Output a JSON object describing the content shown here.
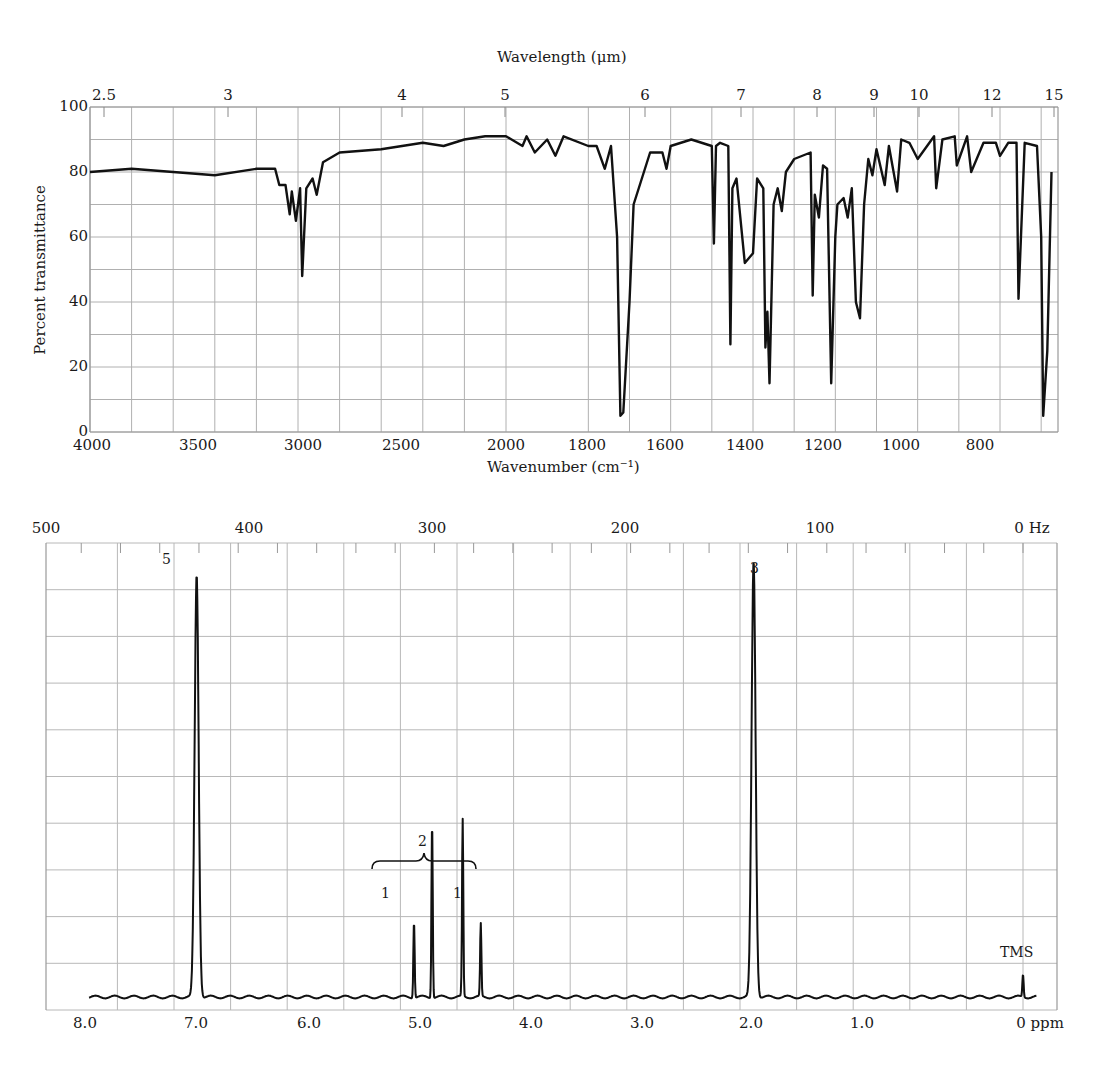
{
  "chart_data": [
    {
      "type": "line",
      "title": "IR spectrum",
      "top_axis": {
        "label": "Wavelength (μm)",
        "ticks": [
          "2.5",
          "3",
          "4",
          "5",
          "6",
          "7",
          "8",
          "9",
          "10",
          "12",
          "15"
        ]
      },
      "xlabel": "Wavenumber (cm⁻¹)",
      "ylabel": "Percent transmittance",
      "x_ticks": [
        "4000",
        "3500",
        "3000",
        "2500",
        "2000",
        "1800",
        "1600",
        "1400",
        "1200",
        "1000",
        "800"
      ],
      "y_ticks": [
        "0",
        "20",
        "40",
        "60",
        "80",
        "100"
      ],
      "xlim": [
        4000,
        670
      ],
      "ylim": [
        0,
        100
      ],
      "grid": true,
      "x": [
        4000,
        3800,
        3600,
        3400,
        3200,
        3110,
        3090,
        3060,
        3040,
        3030,
        3010,
        2990,
        2980,
        2960,
        2930,
        2910,
        2880,
        2800,
        2600,
        2400,
        2300,
        2200,
        2100,
        2000,
        1960,
        1950,
        1930,
        1900,
        1880,
        1860,
        1800,
        1780,
        1760,
        1745,
        1730,
        1722,
        1715,
        1700,
        1690,
        1650,
        1620,
        1610,
        1600,
        1550,
        1500,
        1495,
        1490,
        1480,
        1460,
        1455,
        1450,
        1440,
        1420,
        1400,
        1390,
        1375,
        1370,
        1365,
        1360,
        1350,
        1340,
        1330,
        1320,
        1300,
        1260,
        1255,
        1250,
        1240,
        1230,
        1220,
        1210,
        1200,
        1195,
        1180,
        1170,
        1160,
        1150,
        1140,
        1130,
        1120,
        1110,
        1100,
        1080,
        1070,
        1050,
        1040,
        1020,
        1000,
        960,
        955,
        940,
        910,
        905,
        880,
        870,
        840,
        810,
        800,
        780,
        760,
        755,
        740,
        710,
        700,
        695,
        685,
        675
      ],
      "values": [
        80,
        81,
        80,
        79,
        81,
        81,
        76,
        76,
        67,
        74,
        65,
        75,
        48,
        75,
        78,
        73,
        83,
        86,
        87,
        89,
        88,
        90,
        91,
        91,
        88,
        91,
        86,
        90,
        85,
        91,
        88,
        88,
        81,
        88,
        60,
        5,
        6,
        40,
        70,
        86,
        86,
        81,
        88,
        90,
        88,
        58,
        88,
        89,
        88,
        27,
        75,
        78,
        52,
        55,
        78,
        75,
        26,
        37,
        15,
        70,
        75,
        68,
        80,
        84,
        86,
        42,
        73,
        66,
        82,
        81,
        15,
        60,
        70,
        72,
        66,
        75,
        40,
        35,
        70,
        84,
        79,
        87,
        76,
        88,
        74,
        90,
        89,
        84,
        91,
        75,
        90,
        91,
        82,
        91,
        80,
        89,
        89,
        85,
        89,
        89,
        41,
        89,
        88,
        60,
        5,
        25,
        80
      ],
      "units": {
        "x": "cm⁻¹",
        "y": "%T"
      }
    },
    {
      "type": "line",
      "title": "1H NMR spectrum",
      "top_axis": {
        "label": "Hz",
        "ticks": [
          "500",
          "400",
          "300",
          "200",
          "100",
          "0 Hz"
        ]
      },
      "xlabel": "ppm",
      "x_ticks": [
        "8.0",
        "7.0",
        "6.0",
        "5.0",
        "4.0",
        "3.0",
        "2.0",
        "1.0",
        "0 ppm"
      ],
      "xlim": [
        8.3,
        -0.1
      ],
      "grid": true,
      "peaks": [
        {
          "shift_ppm": 7.3,
          "integration_label": "5",
          "relative_height": 0.93
        },
        {
          "shift_ppm": 5.38,
          "relative_height": 0.17
        },
        {
          "shift_ppm": 5.22,
          "relative_height": 0.39
        },
        {
          "shift_ppm": 4.95,
          "relative_height": 0.39
        },
        {
          "shift_ppm": 4.79,
          "relative_height": 0.16
        },
        {
          "shift_ppm": 2.38,
          "integration_label": "3",
          "relative_height": 0.96
        },
        {
          "shift_ppm": 0.0,
          "label": "TMS",
          "relative_height": 0.05
        }
      ],
      "annotations": [
        {
          "text": "5",
          "at_ppm": 7.3
        },
        {
          "text": "2",
          "type": "brace",
          "from_ppm": 5.5,
          "to_ppm": 4.65
        },
        {
          "text": "1",
          "at_ppm": 5.3
        },
        {
          "text": "1",
          "at_ppm": 4.87
        },
        {
          "text": "3",
          "at_ppm": 2.38
        },
        {
          "text": "TMS",
          "at_ppm": 0.0
        }
      ]
    }
  ],
  "ir": {
    "top_title": "Wavelength (μm)",
    "bottom_title": "Wavenumber (cm⁻¹)",
    "ylabel": "Percent transmittance",
    "top_ticks": [
      {
        "t": "2.5",
        "x": 104
      },
      {
        "t": "3",
        "x": 228
      },
      {
        "t": "4",
        "x": 402
      },
      {
        "t": "5",
        "x": 505
      },
      {
        "t": "6",
        "x": 645
      },
      {
        "t": "7",
        "x": 741
      },
      {
        "t": "8",
        "x": 817
      },
      {
        "t": "9",
        "x": 874
      },
      {
        "t": "10",
        "x": 919
      },
      {
        "t": "12",
        "x": 992
      },
      {
        "t": "15",
        "x": 1054
      }
    ],
    "bottom_ticks": [
      {
        "t": "4000",
        "x": 92
      },
      {
        "t": "3500",
        "x": 198
      },
      {
        "t": "3000",
        "x": 303
      },
      {
        "t": "2500",
        "x": 401
      },
      {
        "t": "2000",
        "x": 506
      },
      {
        "t": "1800",
        "x": 587
      },
      {
        "t": "1600",
        "x": 665
      },
      {
        "t": "1400",
        "x": 745
      },
      {
        "t": "1200",
        "x": 823
      },
      {
        "t": "1000",
        "x": 901
      },
      {
        "t": "800",
        "x": 980
      }
    ],
    "y_ticks": [
      {
        "t": "100",
        "y": 107
      },
      {
        "t": "80",
        "y": 172
      },
      {
        "t": "60",
        "y": 237
      },
      {
        "t": "40",
        "y": 302
      },
      {
        "t": "20",
        "y": 367
      },
      {
        "t": "0",
        "y": 432
      }
    ]
  },
  "nmr": {
    "hz_ticks": [
      {
        "t": "500",
        "x": 46
      },
      {
        "t": "400",
        "x": 249
      },
      {
        "t": "300",
        "x": 432
      },
      {
        "t": "200",
        "x": 625
      },
      {
        "t": "100",
        "x": 820
      },
      {
        "t": "0  Hz",
        "x": 1032
      }
    ],
    "ppm_ticks": [
      {
        "t": "8.0",
        "x": 85
      },
      {
        "t": "7.0",
        "x": 196
      },
      {
        "t": "6.0",
        "x": 309
      },
      {
        "t": "5.0",
        "x": 420
      },
      {
        "t": "4.0",
        "x": 531
      },
      {
        "t": "3.0",
        "x": 642
      },
      {
        "t": "2.0",
        "x": 751
      },
      {
        "t": "1.0",
        "x": 862
      },
      {
        "t": "0 ppm",
        "x": 1040
      }
    ],
    "labels": {
      "peak5": "5",
      "peak3": "3",
      "brace": "2",
      "left1": "1",
      "right1": "1",
      "tms": "TMS"
    }
  }
}
